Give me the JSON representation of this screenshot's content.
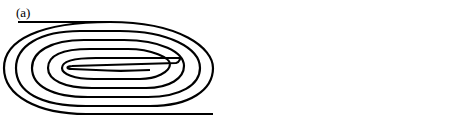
{
  "panels": [
    {
      "id": "a",
      "label": "(a)",
      "strand_order_top_to_bottom": [
        "0",
        "9",
        "2",
        "7",
        "4",
        "5",
        "6",
        "3",
        "8",
        "1",
        "10"
      ],
      "labels": {
        "s0": "0",
        "s9": "9",
        "s2": "2",
        "s7": "7",
        "s4": "4",
        "s5": "5",
        "s6": "6",
        "s3": "3",
        "s8": "8",
        "s1": "1",
        "s10": "10"
      }
    },
    {
      "id": "b",
      "label": "(b)",
      "strand_order_top_to_bottom": [
        "0",
        "2",
        "7",
        "4",
        "5",
        "6",
        "3",
        "9",
        "10",
        "8",
        "1"
      ],
      "labels": {
        "s0": "0",
        "s2": "2",
        "s7": "7",
        "s4": "4",
        "s5": "5",
        "s6": "6",
        "s3": "3",
        "s9": "9",
        "s10": "10",
        "s8": "8",
        "s1": "1"
      }
    }
  ],
  "colors": {
    "stroke": "#000000",
    "background": "#ffffff"
  }
}
